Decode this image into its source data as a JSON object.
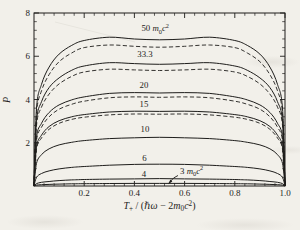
{
  "figure": {
    "bg": "#f2f0ea",
    "ink": "#1e1d1b"
  },
  "chart_data": {
    "type": "line",
    "title": "",
    "ylabel": "P",
    "xlabel_plain": "T+ / (hbar*omega - 2 m0 c^2)",
    "xlabel_rich": [
      {
        "t": "T",
        "i": true
      },
      {
        "t": "+",
        "sub": true
      },
      {
        "t": " / (",
        "i": false
      },
      {
        "t": "ℏω",
        "i": true
      },
      {
        "t": " − 2",
        "i": false
      },
      {
        "t": "m",
        "i": true
      },
      {
        "t": "0",
        "sub": true
      },
      {
        "t": "c",
        "i": true
      },
      {
        "t": "2",
        "sup": true
      },
      {
        "t": ")",
        "i": false
      }
    ],
    "xlim": [
      0,
      1.0
    ],
    "ylim": [
      0,
      8
    ],
    "grid": false,
    "x_major_ticks": [
      0.2,
      0.4,
      0.6,
      0.8,
      1.0
    ],
    "x_tick_labels": [
      "0.2",
      "0.4",
      "0.6",
      "0.8",
      "1.0"
    ],
    "x_minor_step": 0.04,
    "y_major_ticks": [
      8,
      6,
      4,
      2
    ],
    "y_tick_labels": [
      "8",
      "6",
      "4",
      "2"
    ],
    "y_minor_step": 0.4,
    "x": [
      0,
      0.01,
      0.03,
      0.06,
      0.1,
      0.15,
      0.2,
      0.3,
      0.4,
      0.5,
      0.6,
      0.7,
      0.8,
      0.85,
      0.9,
      0.94,
      0.97,
      0.99,
      1
    ],
    "series": [
      {
        "name": "50 m0c2 solid",
        "dashed": false,
        "values": [
          0,
          3.6,
          4.7,
          5.5,
          6.1,
          6.5,
          6.73,
          6.88,
          6.8,
          6.76,
          6.8,
          6.88,
          6.73,
          6.5,
          6.1,
          5.5,
          4.7,
          3.6,
          0
        ]
      },
      {
        "name": "50 m0c2 dashed",
        "dashed": true,
        "values": [
          0,
          3.35,
          4.4,
          5.15,
          5.75,
          6.15,
          6.4,
          6.52,
          6.46,
          6.42,
          6.46,
          6.52,
          6.4,
          6.15,
          5.75,
          5.15,
          4.4,
          3.35,
          0
        ]
      },
      {
        "name": "33.3 solid",
        "dashed": false,
        "values": [
          0,
          3.0,
          3.9,
          4.55,
          5.0,
          5.35,
          5.55,
          5.7,
          5.66,
          5.63,
          5.66,
          5.7,
          5.55,
          5.35,
          5.0,
          4.55,
          3.9,
          3.0,
          0
        ]
      },
      {
        "name": "33.3 dashed",
        "dashed": true,
        "values": [
          0,
          2.8,
          3.65,
          4.25,
          4.72,
          5.07,
          5.27,
          5.4,
          5.37,
          5.34,
          5.37,
          5.4,
          5.27,
          5.07,
          4.72,
          4.25,
          3.65,
          2.8,
          0
        ]
      },
      {
        "name": "20 solid",
        "dashed": false,
        "values": [
          0,
          2.25,
          2.9,
          3.4,
          3.75,
          3.98,
          4.12,
          4.28,
          4.32,
          4.3,
          4.32,
          4.28,
          4.12,
          3.98,
          3.75,
          3.4,
          2.9,
          2.25,
          0
        ]
      },
      {
        "name": "20 dashed",
        "dashed": true,
        "values": [
          0,
          2.1,
          2.72,
          3.2,
          3.55,
          3.78,
          3.92,
          4.08,
          4.12,
          4.1,
          4.12,
          4.08,
          3.92,
          3.78,
          3.55,
          3.2,
          2.72,
          2.1,
          0
        ]
      },
      {
        "name": "15 solid",
        "dashed": false,
        "values": [
          0,
          1.8,
          2.35,
          2.75,
          3.02,
          3.2,
          3.3,
          3.42,
          3.46,
          3.45,
          3.46,
          3.42,
          3.3,
          3.2,
          3.02,
          2.75,
          2.35,
          1.8,
          0
        ]
      },
      {
        "name": "15 dashed",
        "dashed": true,
        "values": [
          0,
          1.7,
          2.22,
          2.62,
          2.9,
          3.08,
          3.18,
          3.29,
          3.33,
          3.32,
          3.33,
          3.29,
          3.18,
          3.08,
          2.9,
          2.62,
          2.22,
          1.7,
          0
        ]
      },
      {
        "name": "10 solid",
        "dashed": false,
        "values": [
          0,
          1.05,
          1.45,
          1.72,
          1.9,
          2.02,
          2.1,
          2.19,
          2.23,
          2.25,
          2.23,
          2.19,
          2.1,
          2.02,
          1.9,
          1.72,
          1.45,
          1.05,
          0
        ]
      },
      {
        "name": "6 solid",
        "dashed": false,
        "values": [
          0,
          0.4,
          0.58,
          0.7,
          0.79,
          0.86,
          0.9,
          0.96,
          1.0,
          1.01,
          1.0,
          0.96,
          0.9,
          0.86,
          0.79,
          0.7,
          0.58,
          0.4,
          0
        ]
      },
      {
        "name": "4 solid",
        "dashed": false,
        "values": [
          0,
          0.11,
          0.17,
          0.21,
          0.25,
          0.28,
          0.3,
          0.32,
          0.33,
          0.34,
          0.33,
          0.32,
          0.3,
          0.28,
          0.25,
          0.21,
          0.17,
          0.11,
          0
        ]
      },
      {
        "name": "3 m0c2 solid",
        "dashed": false,
        "values": [
          0,
          0.04,
          0.06,
          0.075,
          0.09,
          0.1,
          0.107,
          0.115,
          0.12,
          0.12,
          0.12,
          0.115,
          0.107,
          0.1,
          0.09,
          0.075,
          0.06,
          0.04,
          0
        ]
      }
    ],
    "curve_labels": [
      {
        "text": "50 m0c2",
        "x": 0.483,
        "p": 7.15,
        "rich": [
          {
            "t": "50 "
          },
          {
            "t": "m",
            "i": true
          },
          {
            "t": "0",
            "sub": true
          },
          {
            "t": "c",
            "i": true
          },
          {
            "t": "2",
            "sup": true
          }
        ]
      },
      {
        "text": "33.3",
        "x": 0.442,
        "p": 5.95,
        "rich": [
          {
            "t": "33.3"
          }
        ]
      },
      {
        "text": "20",
        "x": 0.438,
        "p": 4.55,
        "rich": [
          {
            "t": "20"
          }
        ]
      },
      {
        "text": "15",
        "x": 0.438,
        "p": 3.65,
        "rich": [
          {
            "t": "15"
          }
        ]
      },
      {
        "text": "10",
        "x": 0.442,
        "p": 2.5,
        "rich": [
          {
            "t": "10"
          }
        ]
      },
      {
        "text": "6",
        "x": 0.44,
        "p": 1.17,
        "rich": [
          {
            "t": "6"
          }
        ]
      },
      {
        "text": "4",
        "x": 0.438,
        "p": 0.43,
        "rich": [
          {
            "t": "4"
          }
        ]
      },
      {
        "text": "3 m0c2",
        "x": 0.628,
        "p": 0.56,
        "rich": [
          {
            "t": "3 "
          },
          {
            "t": "m",
            "i": true
          },
          {
            "t": "0",
            "sub": true
          },
          {
            "t": "c",
            "i": true
          },
          {
            "t": "2",
            "sup": true
          }
        ]
      }
    ],
    "annotation_arrow": {
      "tail": [
        178,
        175.5
      ],
      "ctrl": [
        173.5,
        177
      ],
      "tip": [
        169.3,
        182.6
      ]
    },
    "legend": "none (inline curve labels); dashed curves are companion approximations just below each solid curve for 50, 33.3, 20, 15"
  }
}
